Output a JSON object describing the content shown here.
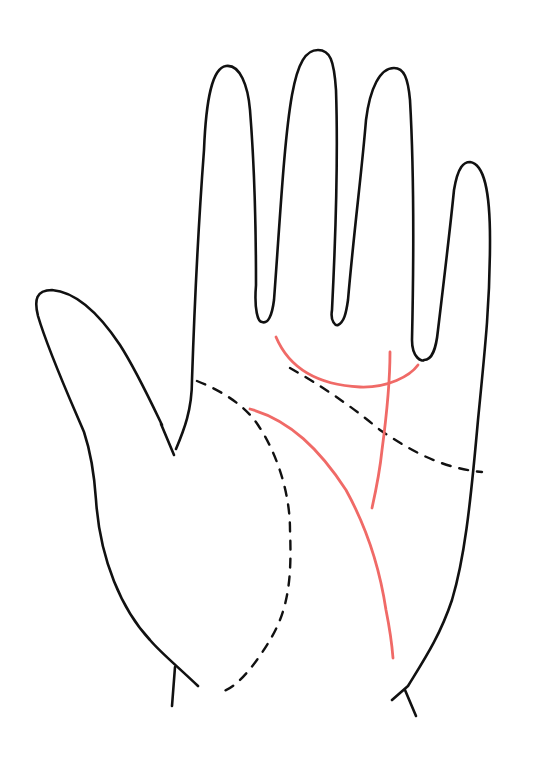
{
  "figure": {
    "subject": "palm line diagram",
    "hand": "open palm, fingers up",
    "colors": {
      "outline": "#111111",
      "dashed_lines": "#111111",
      "highlighted_lines": "#f06a67",
      "background": "#ffffff"
    },
    "lines": {
      "dashed": [
        "head-line-dashed",
        "heart-line-dashed",
        "life-line-dashed"
      ],
      "highlighted": [
        "curved-arc-under-fingers",
        "vertical-fate-line",
        "long-curved-line"
      ]
    }
  }
}
